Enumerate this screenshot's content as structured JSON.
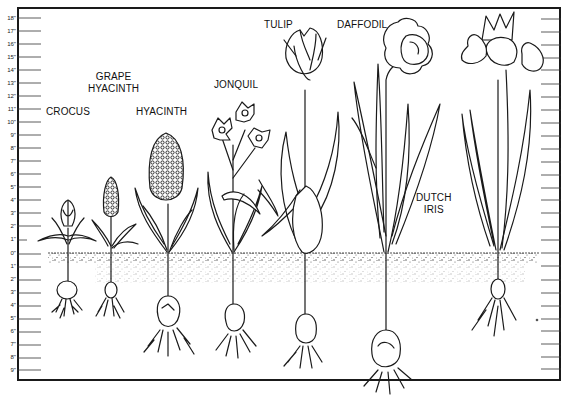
{
  "diagram": {
    "scale": {
      "unit": "inches",
      "above_ground_labels": [
        "18\"",
        "17\"",
        "16\"",
        "15\"",
        "14\"",
        "13\"",
        "12\"",
        "11\"",
        "10\"",
        "9\"",
        "8\"",
        "7\"",
        "6\"",
        "5\"",
        "4\"",
        "3\"",
        "2\"",
        "1\"",
        "0\""
      ],
      "below_ground_labels": [
        "1\"",
        "2\"",
        "3\"",
        "4\"",
        "5\"",
        "6\"",
        "7\"",
        "8\"",
        "9\""
      ]
    },
    "plants": [
      {
        "name": "CROCUS",
        "label_lines": [
          "CROCUS"
        ],
        "height_in": 4,
        "bulb_depth_in": 3
      },
      {
        "name": "GRAPE HYACINTH",
        "label_lines": [
          "GRAPE",
          "HYACINTH"
        ],
        "height_in": 6,
        "bulb_depth_in": 3
      },
      {
        "name": "HYACINTH",
        "label_lines": [
          "HYACINTH"
        ],
        "height_in": 10,
        "bulb_depth_in": 6
      },
      {
        "name": "JONQUIL",
        "label_lines": [
          "JONQUIL"
        ],
        "height_in": 10,
        "bulb_depth_in": 6
      },
      {
        "name": "TULIP",
        "label_lines": [
          "TULIP"
        ],
        "height_in": 17,
        "bulb_depth_in": 6
      },
      {
        "name": "DAFFODIL",
        "label_lines": [
          "DAFFODIL"
        ],
        "height_in": 17,
        "bulb_depth_in": 9
      },
      {
        "name": "DUTCH IRIS",
        "label_lines": [
          "DUTCH",
          "IRIS"
        ],
        "height_in": 16,
        "bulb_depth_in": 4
      }
    ],
    "colors": {
      "ink": "#1a1a1a",
      "soil_speckle": "#333333",
      "paper": "#ffffff"
    }
  }
}
